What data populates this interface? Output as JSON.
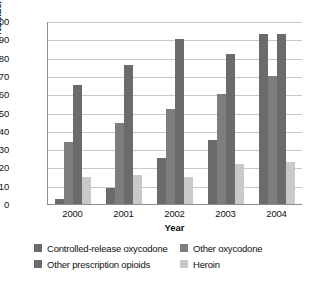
{
  "chart_data": {
    "type": "bar",
    "title": "",
    "xlabel": "Year",
    "ylabel": "Number of Admissions",
    "categories": [
      "2000",
      "2001",
      "2002",
      "2003",
      "2004"
    ],
    "ylim": [
      0,
      100
    ],
    "ytick_step": 10,
    "yticks": [
      100,
      90,
      80,
      70,
      60,
      50,
      40,
      30,
      20,
      10,
      0
    ],
    "grid": true,
    "legend_position": "bottom",
    "series": [
      {
        "name": "Controlled-release oxycodone",
        "color": "#6b6b6b",
        "values": [
          3,
          9,
          25,
          35,
          93
        ]
      },
      {
        "name": "Other oxycodone",
        "color": "#7d7d7d",
        "values": [
          34,
          44,
          52,
          60,
          70
        ]
      },
      {
        "name": "Other prescription opioids",
        "color": "#6b6b6b",
        "values": [
          65,
          76,
          90,
          82,
          93
        ]
      },
      {
        "name": "Heroin",
        "color": "#c9c9c9",
        "values": [
          15,
          16,
          15,
          22,
          23
        ]
      }
    ]
  }
}
